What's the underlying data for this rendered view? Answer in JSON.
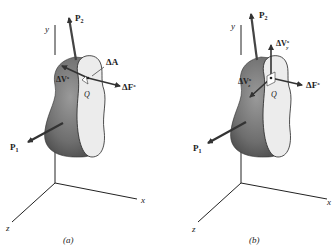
{
  "panels": [
    {
      "caption": "(a)",
      "axes": {
        "x": "x",
        "y": "y",
        "z": "z"
      },
      "forces": {
        "p1": "P",
        "p1_sub": "1",
        "p2": "P",
        "p2_sub": "2"
      },
      "labels": {
        "area": "ΔA",
        "shear": "ΔV",
        "shear_sup": "x",
        "normal": "ΔF",
        "normal_sup": "x",
        "point": "Q"
      }
    },
    {
      "caption": "(b)",
      "axes": {
        "x": "x",
        "y": "y",
        "z": "z"
      },
      "forces": {
        "p1": "P",
        "p1_sub": "1",
        "p2": "P",
        "p2_sub": "2"
      },
      "labels": {
        "shear_y": "ΔV",
        "shear_y_sup": "x",
        "shear_y_sub": "y",
        "shear_z": "ΔV",
        "shear_z_sup": "x",
        "shear_z_sub": "z",
        "normal": "ΔF",
        "normal_sup": "x",
        "point": "Q"
      }
    }
  ],
  "colors": {
    "body_dark": "#5a5a5a",
    "body_mid": "#8c8c8c",
    "face": "#e8e8e8",
    "arrow": "#3a3a3a",
    "axis": "#222222"
  }
}
